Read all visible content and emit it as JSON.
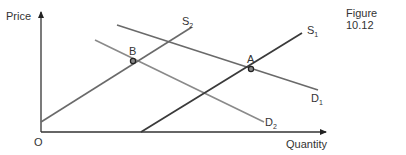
{
  "figure": {
    "title": "Figure 10.12",
    "axes": {
      "ylabel": "Price",
      "xlabel": "Quantity",
      "origin_label": "O"
    },
    "curves": {
      "S1": {
        "label": "S",
        "sub": "1",
        "x1": 141,
        "y1": 132,
        "x2": 302,
        "y2": 33,
        "color": "#3a3a3a"
      },
      "S2": {
        "label": "S",
        "sub": "2",
        "x1": 41,
        "y1": 122,
        "x2": 192,
        "y2": 27,
        "color": "#6a6a6a"
      },
      "D1": {
        "label": "D",
        "sub": "1",
        "x1": 117,
        "y1": 25,
        "x2": 318,
        "y2": 90,
        "color": "#6a6a6a"
      },
      "D2": {
        "label": "D",
        "sub": "2",
        "x1": 95,
        "y1": 40,
        "x2": 264,
        "y2": 122,
        "color": "#8a8a8a"
      }
    },
    "points": {
      "A": {
        "label": "A",
        "x": 251,
        "y": 69
      },
      "B": {
        "label": "B",
        "x": 133,
        "y": 61
      }
    }
  },
  "chart_data": {
    "type": "line",
    "title": "Figure 10.12",
    "xlabel": "Quantity",
    "ylabel": "Price",
    "origin": "O",
    "series": [
      {
        "name": "S1",
        "points": [
          [
            100,
            0
          ],
          [
            261,
            99
          ]
        ]
      },
      {
        "name": "S2",
        "points": [
          [
            0,
            10
          ],
          [
            151,
            105
          ]
        ]
      },
      {
        "name": "D1",
        "points": [
          [
            76,
            107
          ],
          [
            277,
            42
          ]
        ]
      },
      {
        "name": "D2",
        "points": [
          [
            54,
            92
          ],
          [
            223,
            10
          ]
        ]
      }
    ],
    "annotations": [
      {
        "label": "A",
        "desc": "Intersection of S1 and D1",
        "x": 210,
        "y": 63
      },
      {
        "label": "B",
        "desc": "Intersection of S2 and D2",
        "x": 92,
        "y": 71
      }
    ],
    "grid": false,
    "ticks": "none"
  }
}
